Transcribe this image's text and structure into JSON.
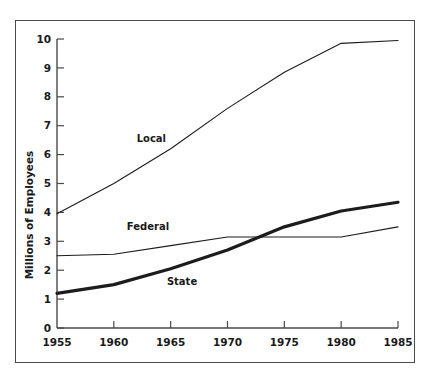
{
  "chart_data": {
    "type": "line",
    "title": "",
    "subtitle": "",
    "xlabel": "",
    "ylabel": "Millions of Employees",
    "xlim": [
      1955,
      1985
    ],
    "ylim": [
      0,
      10
    ],
    "grid": false,
    "legend_position": "inline-annotations",
    "x_ticks": [
      "1955",
      "1960",
      "1965",
      "1970",
      "1975",
      "1980",
      "1985"
    ],
    "y_ticks": [
      "0",
      "1",
      "2",
      "3",
      "4",
      "5",
      "6",
      "7",
      "8",
      "9",
      "10"
    ],
    "x": [
      1955,
      1960,
      1965,
      1970,
      1975,
      1980,
      1985
    ],
    "series": [
      {
        "name": "Local",
        "label": "Local",
        "values": [
          3.95,
          5.0,
          6.2,
          7.6,
          8.85,
          9.85,
          9.95
        ],
        "line_weight": "thin",
        "annotation": {
          "text": "Local",
          "x": 1963.3,
          "y": 6.45
        }
      },
      {
        "name": "Federal",
        "label": "Federal",
        "values": [
          2.5,
          2.55,
          2.85,
          3.15,
          3.15,
          3.15,
          3.5
        ],
        "line_weight": "thin",
        "annotation": {
          "text": "Federal",
          "x": 1963.0,
          "y": 3.4
        }
      },
      {
        "name": "State",
        "label": "State",
        "values": [
          1.2,
          1.5,
          2.05,
          2.7,
          3.5,
          4.05,
          4.35
        ],
        "line_weight": "thick",
        "annotation": {
          "text": "State",
          "x": 1966.0,
          "y": 1.5
        }
      }
    ]
  },
  "colors": {
    "line": "#1c1c1c",
    "axis": "#4a4a4a",
    "frame": "#4b4b4b",
    "background": "#ffffff",
    "text": "#1a1a1a"
  }
}
